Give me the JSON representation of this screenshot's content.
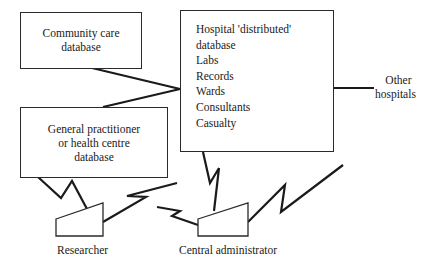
{
  "diagram": {
    "nodes": {
      "community_care": {
        "lines": [
          "Community care",
          "database"
        ]
      },
      "gp": {
        "lines": [
          "General practitioner",
          "or health centre",
          "database"
        ]
      },
      "hospital": {
        "lines": [
          "Hospital 'distributed'",
          "database",
          "Labs",
          "Records",
          "Wards",
          "Consultants",
          "Casualty"
        ]
      },
      "other_hospitals": {
        "lines": [
          "Other",
          "hospitals"
        ]
      },
      "researcher": {
        "label": "Researcher"
      },
      "central_admin": {
        "label": "Central administrator"
      }
    },
    "edges": [
      {
        "from": "community_care",
        "to": "hospital",
        "style": "straight"
      },
      {
        "from": "gp",
        "to": "hospital",
        "style": "straight"
      },
      {
        "from": "hospital",
        "to": "other_hospitals",
        "style": "straight"
      },
      {
        "from": "gp",
        "to": "researcher",
        "style": "zigzag"
      },
      {
        "from": "researcher",
        "to": "central_admin",
        "style": "zigzag"
      },
      {
        "from": "hospital",
        "to": "central_admin",
        "style": "zigzag"
      },
      {
        "from": "central_admin",
        "to": "external",
        "style": "zigzag"
      }
    ]
  }
}
